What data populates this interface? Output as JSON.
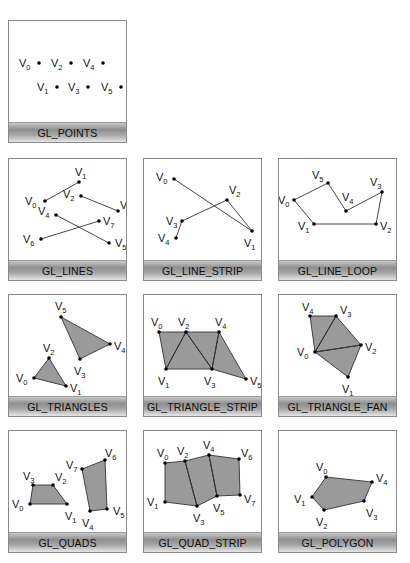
{
  "panels": [
    {
      "id": "points",
      "label": "GL_POINTS",
      "left": 8,
      "top": 20,
      "fill": false,
      "edges": [],
      "polys": [],
      "vertices": [
        {
          "name": "0",
          "x": 30,
          "y": 42,
          "lx": -20,
          "ly": 4
        },
        {
          "name": "1",
          "x": 48,
          "y": 66,
          "lx": -20,
          "ly": 4
        },
        {
          "name": "2",
          "x": 62,
          "y": 42,
          "lx": -20,
          "ly": 4
        },
        {
          "name": "3",
          "x": 79,
          "y": 66,
          "lx": -20,
          "ly": 4
        },
        {
          "name": "4",
          "x": 94,
          "y": 42,
          "lx": -20,
          "ly": 4
        },
        {
          "name": "5",
          "x": 112,
          "y": 66,
          "lx": -20,
          "ly": 4
        }
      ]
    },
    {
      "id": "lines",
      "label": "GL_LINES",
      "left": 8,
      "top": 158,
      "fill": false,
      "edges": [
        [
          0,
          1
        ],
        [
          2,
          3
        ],
        [
          4,
          5
        ],
        [
          6,
          7
        ]
      ],
      "polys": [],
      "vertices": [
        {
          "name": "0",
          "x": 36,
          "y": 42,
          "lx": -20,
          "ly": 4
        },
        {
          "name": "1",
          "x": 70,
          "y": 23,
          "lx": -4,
          "ly": -6
        },
        {
          "name": "2",
          "x": 72,
          "y": 37,
          "lx": -18,
          "ly": 2
        },
        {
          "name": "3",
          "x": 109,
          "y": 52,
          "lx": 2,
          "ly": -2
        },
        {
          "name": "4",
          "x": 47,
          "y": 56,
          "lx": -18,
          "ly": 0
        },
        {
          "name": "5",
          "x": 100,
          "y": 84,
          "lx": 6,
          "ly": 4
        },
        {
          "name": "6",
          "x": 32,
          "y": 80,
          "lx": -18,
          "ly": 4
        },
        {
          "name": "7",
          "x": 90,
          "y": 62,
          "lx": 4,
          "ly": 4
        }
      ]
    },
    {
      "id": "line-strip",
      "label": "GL_LINE_STRIP",
      "left": 143,
      "top": 158,
      "fill": false,
      "edges": [
        [
          0,
          1
        ],
        [
          1,
          2
        ],
        [
          2,
          3
        ],
        [
          3,
          4
        ]
      ],
      "polys": [],
      "vertices": [
        {
          "name": "0",
          "x": 30,
          "y": 20,
          "lx": -18,
          "ly": 2
        },
        {
          "name": "1",
          "x": 108,
          "y": 72,
          "lx": -8,
          "ly": 16
        },
        {
          "name": "2",
          "x": 83,
          "y": 41,
          "lx": 2,
          "ly": -6
        },
        {
          "name": "3",
          "x": 38,
          "y": 62,
          "lx": -16,
          "ly": 4
        },
        {
          "name": "4",
          "x": 32,
          "y": 79,
          "lx": -18,
          "ly": 4
        }
      ]
    },
    {
      "id": "line-loop",
      "label": "GL_LINE_LOOP",
      "left": 278,
      "top": 158,
      "fill": false,
      "edges": [
        [
          0,
          1
        ],
        [
          1,
          2
        ],
        [
          2,
          3
        ],
        [
          3,
          4
        ],
        [
          4,
          5
        ],
        [
          5,
          0
        ]
      ],
      "polys": [],
      "vertices": [
        {
          "name": "0",
          "x": 15,
          "y": 41,
          "lx": -16,
          "ly": 4
        },
        {
          "name": "1",
          "x": 35,
          "y": 65,
          "lx": -16,
          "ly": 6
        },
        {
          "name": "2",
          "x": 97,
          "y": 65,
          "lx": 4,
          "ly": 6
        },
        {
          "name": "3",
          "x": 103,
          "y": 33,
          "lx": -12,
          "ly": -6
        },
        {
          "name": "4",
          "x": 67,
          "y": 52,
          "lx": -4,
          "ly": -10
        },
        {
          "name": "5",
          "x": 49,
          "y": 24,
          "lx": -16,
          "ly": -4
        }
      ]
    },
    {
      "id": "triangles",
      "label": "GL_TRIANGLES",
      "left": 8,
      "top": 294,
      "fill": true,
      "edges": [],
      "polys": [
        [
          0,
          1,
          2
        ],
        [
          3,
          4,
          5
        ]
      ],
      "vertices": [
        {
          "name": "0",
          "x": 25,
          "y": 83,
          "lx": -18,
          "ly": 4
        },
        {
          "name": "1",
          "x": 57,
          "y": 91,
          "lx": 4,
          "ly": 6
        },
        {
          "name": "2",
          "x": 40,
          "y": 63,
          "lx": -6,
          "ly": -6
        },
        {
          "name": "3",
          "x": 71,
          "y": 64,
          "lx": -6,
          "ly": 16
        },
        {
          "name": "4",
          "x": 101,
          "y": 49,
          "lx": 4,
          "ly": 6
        },
        {
          "name": "5",
          "x": 52,
          "y": 22,
          "lx": -6,
          "ly": -7
        }
      ]
    },
    {
      "id": "triangle-strip",
      "label": "GL_TRIANGLE_STRIP",
      "left": 143,
      "top": 294,
      "fill": true,
      "edges": [
        [
          1,
          2
        ],
        [
          2,
          3
        ],
        [
          3,
          4
        ]
      ],
      "polys": [
        [
          0,
          2,
          1
        ],
        [
          2,
          3,
          1
        ],
        [
          2,
          4,
          3
        ],
        [
          4,
          5,
          3
        ]
      ],
      "vertices": [
        {
          "name": "0",
          "x": 15,
          "y": 37,
          "lx": -8,
          "ly": -6
        },
        {
          "name": "1",
          "x": 22,
          "y": 74,
          "lx": -8,
          "ly": 16
        },
        {
          "name": "2",
          "x": 42,
          "y": 37,
          "lx": -8,
          "ly": -6
        },
        {
          "name": "3",
          "x": 68,
          "y": 74,
          "lx": -8,
          "ly": 16
        },
        {
          "name": "4",
          "x": 75,
          "y": 37,
          "lx": -4,
          "ly": -6
        },
        {
          "name": "5",
          "x": 102,
          "y": 84,
          "lx": 4,
          "ly": 6
        }
      ]
    },
    {
      "id": "triangle-fan",
      "label": "GL_TRIANGLE_FAN",
      "left": 278,
      "top": 294,
      "fill": true,
      "edges": [
        [
          0,
          2
        ],
        [
          0,
          3
        ]
      ],
      "polys": [
        [
          0,
          1,
          2
        ],
        [
          0,
          2,
          3
        ],
        [
          0,
          3,
          4
        ]
      ],
      "vertices": [
        {
          "name": "0",
          "x": 36,
          "y": 57,
          "lx": -18,
          "ly": 4
        },
        {
          "name": "1",
          "x": 69,
          "y": 82,
          "lx": -6,
          "ly": 16
        },
        {
          "name": "2",
          "x": 82,
          "y": 50,
          "lx": 4,
          "ly": 6
        },
        {
          "name": "3",
          "x": 57,
          "y": 21,
          "lx": 4,
          "ly": -2
        },
        {
          "name": "4",
          "x": 31,
          "y": 21,
          "lx": -8,
          "ly": -5
        }
      ]
    },
    {
      "id": "quads",
      "label": "GL_QUADS",
      "left": 8,
      "top": 430,
      "fill": true,
      "edges": [],
      "polys": [
        [
          0,
          1,
          2,
          3
        ],
        [
          4,
          5,
          6,
          7
        ]
      ],
      "vertices": [
        {
          "name": "0",
          "x": 21,
          "y": 73,
          "lx": -18,
          "ly": 4
        },
        {
          "name": "1",
          "x": 58,
          "y": 73,
          "lx": -2,
          "ly": 16
        },
        {
          "name": "2",
          "x": 44,
          "y": 54,
          "lx": 2,
          "ly": -4
        },
        {
          "name": "3",
          "x": 24,
          "y": 54,
          "lx": -10,
          "ly": -5
        },
        {
          "name": "4",
          "x": 81,
          "y": 80,
          "lx": -8,
          "ly": 16
        },
        {
          "name": "5",
          "x": 98,
          "y": 78,
          "lx": 6,
          "ly": 6
        },
        {
          "name": "6",
          "x": 96,
          "y": 29,
          "lx": 0,
          "ly": -3
        },
        {
          "name": "7",
          "x": 73,
          "y": 38,
          "lx": -16,
          "ly": 0
        }
      ]
    },
    {
      "id": "quad-strip",
      "label": "GL_QUAD_STRIP",
      "left": 143,
      "top": 430,
      "fill": true,
      "edges": [
        [
          2,
          3
        ],
        [
          4,
          5
        ]
      ],
      "polys": [
        [
          0,
          2,
          3,
          1
        ],
        [
          2,
          4,
          5,
          3
        ],
        [
          4,
          6,
          7,
          5
        ]
      ],
      "vertices": [
        {
          "name": "0",
          "x": 21,
          "y": 32,
          "lx": -8,
          "ly": -6
        },
        {
          "name": "1",
          "x": 21,
          "y": 71,
          "lx": -18,
          "ly": 4
        },
        {
          "name": "2",
          "x": 41,
          "y": 30,
          "lx": -8,
          "ly": -6
        },
        {
          "name": "3",
          "x": 53,
          "y": 75,
          "lx": -4,
          "ly": 16
        },
        {
          "name": "4",
          "x": 65,
          "y": 24,
          "lx": -6,
          "ly": -6
        },
        {
          "name": "5",
          "x": 73,
          "y": 65,
          "lx": -4,
          "ly": 16
        },
        {
          "name": "6",
          "x": 95,
          "y": 28,
          "lx": 2,
          "ly": -2
        },
        {
          "name": "7",
          "x": 96,
          "y": 64,
          "lx": 4,
          "ly": 8
        }
      ]
    },
    {
      "id": "polygon",
      "label": "GL_POLYGON",
      "left": 278,
      "top": 430,
      "fill": true,
      "edges": [],
      "polys": [
        [
          0,
          1,
          2,
          3,
          4
        ]
      ],
      "vertices": [
        {
          "name": "0",
          "x": 47,
          "y": 46,
          "lx": -10,
          "ly": -6
        },
        {
          "name": "1",
          "x": 33,
          "y": 66,
          "lx": -18,
          "ly": 6
        },
        {
          "name": "2",
          "x": 45,
          "y": 79,
          "lx": -8,
          "ly": 16
        },
        {
          "name": "3",
          "x": 85,
          "y": 70,
          "lx": 2,
          "ly": 16
        },
        {
          "name": "4",
          "x": 93,
          "y": 51,
          "lx": 4,
          "ly": 0
        }
      ]
    }
  ],
  "colors": {
    "fill": "#9a9a9a",
    "stroke": "#333333",
    "vertex": "#000000",
    "panel_border": "#8a8a8a"
  }
}
